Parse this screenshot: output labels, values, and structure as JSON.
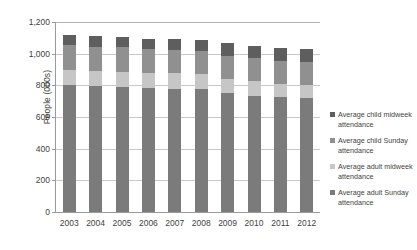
{
  "chart_data": {
    "type": "bar",
    "stacked": true,
    "title": "",
    "xlabel": "",
    "ylabel": "People (000s)",
    "ylim": [
      0,
      1200
    ],
    "yticks": [
      0,
      200,
      400,
      600,
      800,
      1000,
      1200
    ],
    "ytick_labels": [
      "0",
      "200",
      "400",
      "600",
      "800",
      "1,000",
      "1,200"
    ],
    "grid": true,
    "legend_position": "right",
    "categories": [
      "2003",
      "2004",
      "2005",
      "2006",
      "2007",
      "2008",
      "2009",
      "2010",
      "2011",
      "2012"
    ],
    "series": [
      {
        "name": "Average adult Sunday attendance",
        "color": "#7b7b7b",
        "values": [
          800,
          795,
          790,
          785,
          780,
          775,
          750,
          735,
          725,
          720
        ]
      },
      {
        "name": "Average adult midweek attendance",
        "color": "#c6c6c6",
        "values": [
          100,
          95,
          95,
          95,
          95,
          95,
          90,
          90,
          85,
          85
        ]
      },
      {
        "name": "Average child Sunday attendance",
        "color": "#909090",
        "values": [
          155,
          155,
          155,
          150,
          150,
          150,
          145,
          145,
          145,
          145
        ]
      },
      {
        "name": "Average child midweek attendance",
        "color": "#5e5e5e",
        "values": [
          65,
          65,
          65,
          65,
          65,
          65,
          80,
          80,
          80,
          80
        ]
      }
    ],
    "totals": [
      1120,
      1110,
      1105,
      1095,
      1090,
      1085,
      1065,
      1050,
      1035,
      1030
    ]
  },
  "legend": {
    "entries": [
      {
        "label": "Average child midweek attendance",
        "color": "#5e5e5e"
      },
      {
        "label": "Average child Sunday attendance",
        "color": "#909090"
      },
      {
        "label": "Average adult midweek attendance",
        "color": "#c6c6c6"
      },
      {
        "label": "Average adult Sunday attendance",
        "color": "#7b7b7b"
      }
    ]
  }
}
